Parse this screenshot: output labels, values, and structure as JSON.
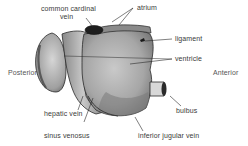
{
  "diagram": {
    "orientation": {
      "left": "Posterior",
      "right": "Anterior"
    },
    "labels": {
      "common_cardinal_vein_line1": "common cardinal",
      "common_cardinal_vein_line2": "vein",
      "atrium": "atrium",
      "ligament": "ligament",
      "ventricle": "ventricle",
      "bulbus": "bulbus",
      "hepatic_vein": "hepatic vein",
      "sinus_venosus": "sinus venosus",
      "inferior_jugular_vein": "inferior jugular vein"
    },
    "colors": {
      "ink": "#2a2a2a",
      "shade_dark": "#5a5a5a",
      "shade_mid": "#9a9a9a",
      "shade_light": "#d0d0d0",
      "label_text": "#3a3a3a"
    }
  }
}
